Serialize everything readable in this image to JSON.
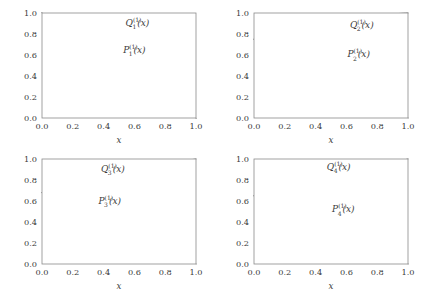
{
  "figure": {
    "background": "#ffffff",
    "curve_color": "#6b6b6b",
    "frame_color": "#8a8a8a",
    "grid_color": "#d8d8d8",
    "axis_label_x": "x",
    "grid": true
  },
  "chart_data": [
    {
      "type": "line",
      "panel": "top-left",
      "title": "",
      "xlabel": "x",
      "ylabel": "",
      "xlim": [
        0.0,
        1.0
      ],
      "ylim": [
        0.0,
        1.0
      ],
      "xticks": [
        "0.0",
        "0.2",
        "0.4",
        "0.6",
        "0.8",
        "1.0"
      ],
      "yticks": [
        "0.0",
        "0.2",
        "0.4",
        "0.6",
        "0.8",
        "1.0"
      ],
      "xtick_values": [
        0.0,
        0.2,
        0.4,
        0.6,
        0.8,
        1.0
      ],
      "ytick_values": [
        0.0,
        0.2,
        0.4,
        0.6,
        0.8,
        1.0
      ],
      "grid": true,
      "legend": "inline-annotations",
      "series": [
        {
          "name": "Q_1^(1)(x)",
          "label_base": "Q",
          "label_sub": "1",
          "label_sup": "(1)",
          "label_arg": "(x)",
          "label_x": 0.62,
          "label_y": 0.88,
          "x": [
            0.0,
            0.1,
            0.2,
            0.3,
            0.4,
            0.5,
            0.6,
            0.7,
            0.8,
            0.9,
            1.0
          ],
          "values": [
            1.0,
            0.9,
            0.8,
            0.7,
            0.6,
            0.5,
            0.4,
            0.3,
            0.2,
            0.1,
            0.0
          ]
        },
        {
          "name": "P_1^(1)(x)",
          "label_base": "P",
          "label_sub": "1",
          "label_sup": "(1)",
          "label_arg": "(x)",
          "label_x": 0.6,
          "label_y": 0.62,
          "x": [
            0.0,
            0.1,
            0.2,
            0.3,
            0.4,
            0.5,
            0.6,
            0.7,
            0.8,
            0.9,
            1.0
          ],
          "values": [
            1.0,
            0.9,
            0.8,
            0.7,
            0.6,
            0.5,
            0.4,
            0.3,
            0.2,
            0.1,
            0.0
          ]
        }
      ]
    },
    {
      "type": "line",
      "panel": "top-right",
      "title": "",
      "xlabel": "x",
      "ylabel": "",
      "xlim": [
        0.0,
        1.0
      ],
      "ylim": [
        0.0,
        1.0
      ],
      "xticks": [
        "0.0",
        "0.2",
        "0.4",
        "0.6",
        "0.8",
        "1.0"
      ],
      "yticks": [
        "0.0",
        "0.2",
        "0.4",
        "0.6",
        "0.8",
        "1.0"
      ],
      "xtick_values": [
        0.0,
        0.2,
        0.4,
        0.6,
        0.8,
        1.0
      ],
      "ytick_values": [
        0.0,
        0.2,
        0.4,
        0.6,
        0.8,
        1.0
      ],
      "grid": true,
      "legend": "inline-annotations",
      "series": [
        {
          "name": "Q_2^(1)(x)",
          "label_base": "Q",
          "label_sub": "2",
          "label_sup": "(1)",
          "label_arg": "(x)",
          "label_x": 0.7,
          "label_y": 0.86,
          "x": [
            0.0,
            0.1,
            0.2,
            0.3,
            0.4,
            0.5,
            0.6,
            0.7,
            0.8,
            0.9,
            1.0
          ],
          "values": [
            0.75,
            0.757,
            0.778,
            0.808,
            0.845,
            0.884,
            0.92,
            0.951,
            0.975,
            0.991,
            1.0
          ]
        },
        {
          "name": "P_2^(1)(x)",
          "label_base": "P",
          "label_sub": "2",
          "label_sup": "(1)",
          "label_arg": "(x)",
          "label_x": 0.68,
          "label_y": 0.58,
          "x": [
            0.0,
            0.1,
            0.2,
            0.3,
            0.4,
            0.5,
            0.6,
            0.7,
            0.8,
            0.9,
            1.0
          ],
          "values": [
            0.75,
            0.745,
            0.73,
            0.706,
            0.672,
            0.628,
            0.572,
            0.5,
            0.405,
            0.268,
            0.0
          ]
        }
      ]
    },
    {
      "type": "line",
      "panel": "bottom-left",
      "title": "",
      "xlabel": "x",
      "ylabel": "",
      "xlim": [
        0.0,
        1.0
      ],
      "ylim": [
        0.0,
        1.0
      ],
      "xticks": [
        "0.0",
        "0.2",
        "0.4",
        "0.6",
        "0.8",
        "1.0"
      ],
      "yticks": [
        "0.0",
        "0.2",
        "0.4",
        "0.6",
        "0.8",
        "1.0"
      ],
      "xtick_values": [
        0.0,
        0.2,
        0.4,
        0.6,
        0.8,
        1.0
      ],
      "ytick_values": [
        0.0,
        0.2,
        0.4,
        0.6,
        0.8,
        1.0
      ],
      "grid": true,
      "legend": "inline-annotations",
      "series": [
        {
          "name": "Q_3^(1)(x)",
          "label_base": "Q",
          "label_sub": "3",
          "label_sup": "(1)",
          "label_arg": "(x)",
          "label_x": 0.46,
          "label_y": 0.88,
          "x": [
            0.0,
            0.1,
            0.2,
            0.3,
            0.4,
            0.5,
            0.6,
            0.7,
            0.8,
            0.9,
            1.0
          ],
          "values": [
            0.68,
            0.681,
            0.684,
            0.693,
            0.715,
            0.757,
            0.816,
            0.88,
            0.935,
            0.977,
            1.0
          ]
        },
        {
          "name": "P_3^(1)(x)",
          "label_base": "P",
          "label_sub": "3",
          "label_sup": "(1)",
          "label_arg": "(x)",
          "label_x": 0.44,
          "label_y": 0.575,
          "x": [
            0.0,
            0.1,
            0.2,
            0.3,
            0.4,
            0.5,
            0.6,
            0.7,
            0.8,
            0.9,
            1.0
          ],
          "values": [
            0.68,
            0.679,
            0.676,
            0.668,
            0.652,
            0.622,
            0.575,
            0.505,
            0.405,
            0.262,
            0.0
          ]
        }
      ]
    },
    {
      "type": "line",
      "panel": "bottom-right",
      "title": "",
      "xlabel": "x",
      "ylabel": "",
      "xlim": [
        0.0,
        1.0
      ],
      "ylim": [
        0.0,
        1.0
      ],
      "xticks": [
        "0.0",
        "0.2",
        "0.4",
        "0.6",
        "0.8",
        "1.0"
      ],
      "yticks": [
        "0.0",
        "0.2",
        "0.4",
        "0.6",
        "0.8",
        "1.0"
      ],
      "xtick_values": [
        0.0,
        0.2,
        0.4,
        0.6,
        0.8,
        1.0
      ],
      "ytick_values": [
        0.0,
        0.2,
        0.4,
        0.6,
        0.8,
        1.0
      ],
      "grid": true,
      "legend": "inline-annotations",
      "series": [
        {
          "name": "Q_4^(1)(x)",
          "label_base": "Q",
          "label_sub": "4",
          "label_sup": "(1)",
          "label_arg": "(x)",
          "label_x": 0.55,
          "label_y": 0.9,
          "x": [
            0.0,
            0.1,
            0.2,
            0.3,
            0.4,
            0.5,
            0.6,
            0.7,
            0.8,
            0.9,
            1.0
          ],
          "values": [
            0.65,
            0.65,
            0.651,
            0.654,
            0.663,
            0.686,
            0.733,
            0.805,
            0.89,
            0.962,
            1.0
          ]
        },
        {
          "name": "P_4^(1)(x)",
          "label_base": "P",
          "label_sub": "4",
          "label_sup": "(1)",
          "label_arg": "(x)",
          "label_x": 0.58,
          "label_y": 0.495,
          "x": [
            0.0,
            0.1,
            0.2,
            0.3,
            0.4,
            0.5,
            0.6,
            0.7,
            0.8,
            0.9,
            1.0
          ],
          "values": [
            0.65,
            0.65,
            0.649,
            0.646,
            0.639,
            0.623,
            0.591,
            0.534,
            0.443,
            0.3,
            0.0
          ]
        }
      ]
    }
  ]
}
